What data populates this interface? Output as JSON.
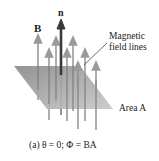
{
  "figure": {
    "labels": {
      "field_vector": "B",
      "normal_vector": "n",
      "field_lines_line1": "Magnetic",
      "field_lines_line2": "field lines",
      "area": "Area A",
      "caption": "(a) θ = 0; Φ = BA"
    },
    "colors": {
      "plane": "#8f8f8f",
      "plane_light": "#c4c4c4",
      "field_arrow": "#9a9a9a",
      "normal_arrow": "#3a3a3a",
      "text": "#222222"
    },
    "plane": {
      "points": [
        [
          14,
          66
        ],
        [
          80,
          66
        ],
        [
          113,
          109
        ],
        [
          47,
          109
        ]
      ]
    },
    "field_arrows": [
      {
        "x": 38,
        "top": 36,
        "bottom": 100
      },
      {
        "x": 49,
        "top": 50,
        "bottom": 120
      },
      {
        "x": 56,
        "top": 38,
        "bottom": 104
      },
      {
        "x": 67,
        "top": 50,
        "bottom": 121
      },
      {
        "x": 73,
        "top": 38,
        "bottom": 111
      },
      {
        "x": 78,
        "top": 63,
        "bottom": 129
      },
      {
        "x": 85,
        "top": 50,
        "bottom": 121
      },
      {
        "x": 96,
        "top": 63,
        "bottom": 130
      }
    ],
    "normal_arrow": {
      "x": 61,
      "top": 21,
      "bottom": 75
    }
  }
}
